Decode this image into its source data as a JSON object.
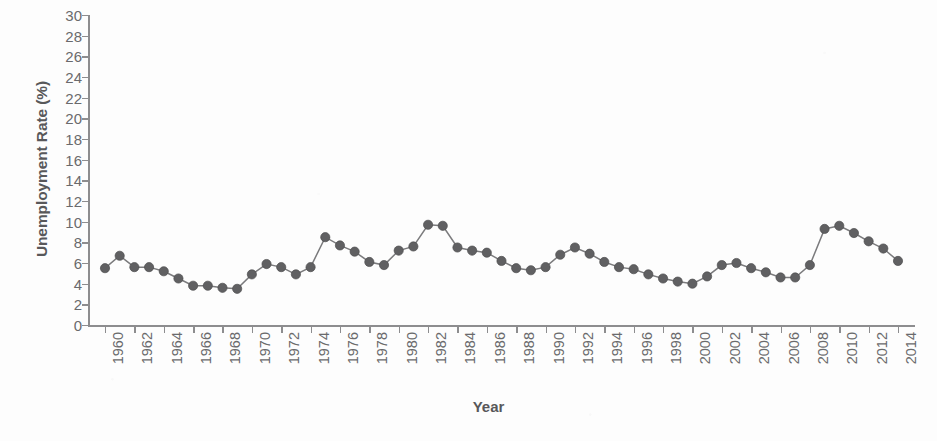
{
  "chart_data": {
    "type": "line",
    "title": "",
    "xlabel": "Year",
    "ylabel": "Unemployment Rate (%)",
    "xlim": [
      1960,
      2014
    ],
    "ylim": [
      0,
      30
    ],
    "ytick_step": 2,
    "xtick_step": 2,
    "grid": false,
    "legend": "none",
    "marker": "filled-circle",
    "marker_color": "#606062",
    "line_color": "#7b7b7d",
    "yticks": [
      "0",
      "2",
      "4",
      "6",
      "8",
      "10",
      "12",
      "14",
      "16",
      "18",
      "20",
      "22",
      "24",
      "26",
      "28",
      "30"
    ],
    "xticks": [
      "1960",
      "1962",
      "1964",
      "1966",
      "1968",
      "1970",
      "1972",
      "1974",
      "1976",
      "1978",
      "1980",
      "1982",
      "1984",
      "1986",
      "1988",
      "1990",
      "1992",
      "1994",
      "1996",
      "1998",
      "2000",
      "2002",
      "2004",
      "2006",
      "2008",
      "2010",
      "2012",
      "2014"
    ],
    "x": [
      1960,
      1961,
      1962,
      1963,
      1964,
      1965,
      1966,
      1967,
      1968,
      1969,
      1970,
      1971,
      1972,
      1973,
      1974,
      1975,
      1976,
      1977,
      1978,
      1979,
      1980,
      1981,
      1982,
      1983,
      1984,
      1985,
      1986,
      1987,
      1988,
      1989,
      1990,
      1991,
      1992,
      1993,
      1994,
      1995,
      1996,
      1997,
      1998,
      1999,
      2000,
      2001,
      2002,
      2003,
      2004,
      2005,
      2006,
      2007,
      2008,
      2009,
      2010,
      2011,
      2012,
      2013,
      2014
    ],
    "values": [
      5.5,
      6.7,
      5.6,
      5.6,
      5.2,
      4.5,
      3.8,
      3.8,
      3.6,
      3.5,
      4.9,
      5.9,
      5.6,
      4.9,
      5.6,
      8.5,
      7.7,
      7.1,
      6.1,
      5.8,
      7.2,
      7.6,
      9.7,
      9.6,
      7.5,
      7.2,
      7.0,
      6.2,
      5.5,
      5.3,
      5.6,
      6.8,
      7.5,
      6.9,
      6.1,
      5.6,
      5.4,
      4.9,
      4.5,
      4.2,
      4.0,
      4.7,
      5.8,
      6.0,
      5.5,
      5.1,
      4.6,
      4.6,
      5.8,
      9.3,
      9.6,
      8.9,
      8.1,
      7.4,
      6.2
    ]
  },
  "axis": {
    "y_title": "Unemployment Rate (%)",
    "x_title": "Year"
  }
}
